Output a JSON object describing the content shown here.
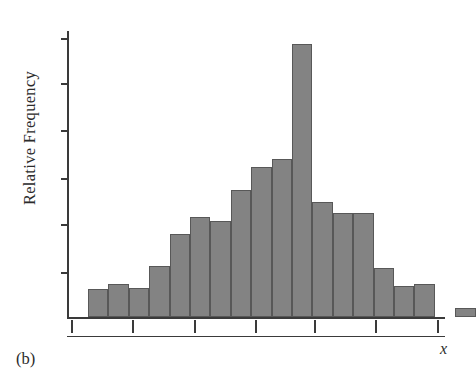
{
  "figure": {
    "panel_label": "(b)",
    "x_axis_label": "x",
    "y_axis_label": "Relative Frequency",
    "bar_fill_color": "#838383",
    "bar_edge_color": "#585858",
    "axis_color": "#3a3a3a",
    "background_color": "#ffffff"
  },
  "chart_data": {
    "type": "bar",
    "title": "",
    "subtitle": "",
    "xlabel": "x",
    "ylabel": "Relative Frequency",
    "grid": false,
    "legend": null,
    "legend_position": "none",
    "annotations": [
      "(b)"
    ],
    "x_tick_labels": [
      "",
      "",
      "",
      "",
      "",
      "",
      ""
    ],
    "y_tick_labels": [
      "",
      "",
      "",
      "",
      "",
      ""
    ],
    "n_x_ticks": 7,
    "n_y_ticks": 6,
    "xlim": [
      0,
      19
    ],
    "ylim": [
      0,
      1
    ],
    "bin_count": 18,
    "note": "Unimodal, roughly symmetric (bell-shaped) relative frequency histogram; one isolated low bar at the far right separated by an empty bin.",
    "categories": [
      "bin1",
      "bin2",
      "bin3",
      "bin4",
      "bin5",
      "bin6",
      "bin7",
      "bin8",
      "bin9",
      "bin10",
      "bin11",
      "bin12",
      "bin13",
      "bin14",
      "bin15",
      "bin16",
      "bin17",
      "bin18"
    ],
    "values": [
      0.098,
      0.115,
      0.101,
      0.178,
      0.29,
      0.35,
      0.336,
      0.444,
      0.524,
      0.552,
      0.955,
      0.402,
      0.364,
      0.364,
      0.171,
      0.108,
      0.115,
      0.031
    ],
    "bin_left_slots": [
      0,
      1,
      2,
      3,
      4,
      5,
      6,
      7,
      8,
      9,
      10,
      11,
      12,
      13,
      14,
      15,
      16,
      18
    ],
    "series": [
      {
        "name": "Relative Frequency",
        "values": [
          0.098,
          0.115,
          0.101,
          0.178,
          0.29,
          0.35,
          0.336,
          0.444,
          0.524,
          0.552,
          0.955,
          0.402,
          0.364,
          0.364,
          0.171,
          0.108,
          0.115,
          0.031
        ]
      }
    ]
  },
  "geometry": {
    "baseline_y": 317,
    "plot_top_y": 31,
    "axis_left_x": 67,
    "bar_width": 20.4,
    "first_bar_x": 88,
    "x_tick_positions": [
      71,
      132,
      194,
      255,
      314,
      375,
      437
    ],
    "y_tick_positions": [
      38,
      83,
      130,
      178,
      224,
      272
    ]
  }
}
